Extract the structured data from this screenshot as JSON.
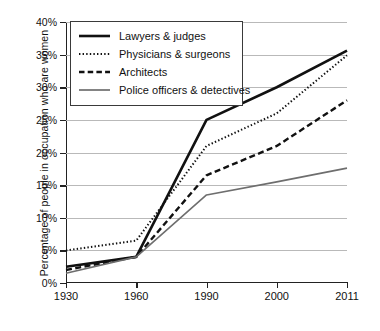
{
  "chart_data": {
    "type": "line",
    "title": "",
    "xlabel": "",
    "ylabel": "Percentage of people in occupation who are women",
    "x": [
      "1930",
      "1960",
      "1990",
      "2000",
      "2011"
    ],
    "categories": [
      "1930",
      "1960",
      "1990",
      "2000",
      "2011"
    ],
    "ylim": [
      0,
      40
    ],
    "yticks": [
      0,
      5,
      10,
      15,
      20,
      25,
      30,
      35,
      40
    ],
    "ytick_labels": [
      "0%",
      "5%",
      "10%",
      "15%",
      "20%",
      "25%",
      "30%",
      "35%",
      "40%"
    ],
    "grid": true,
    "legend_position": "top-left",
    "series": [
      {
        "name": "Lawyers & judges",
        "style": "solid",
        "color": "#111111",
        "width": 2.6,
        "values": [
          2.5,
          4.0,
          25.0,
          30.0,
          35.6
        ]
      },
      {
        "name": "Physicians & surgeons",
        "style": "dotted",
        "color": "#111111",
        "width": 2.0,
        "values": [
          5.0,
          6.5,
          21.0,
          26.0,
          34.9
        ]
      },
      {
        "name": "Architects",
        "style": "dashed",
        "color": "#111111",
        "width": 2.4,
        "values": [
          2.0,
          4.0,
          16.5,
          21.0,
          28.0
        ]
      },
      {
        "name": "Police officers & detectives",
        "style": "solid",
        "color": "#6e6e6e",
        "width": 1.6,
        "values": [
          1.5,
          4.0,
          13.5,
          15.5,
          17.6
        ]
      }
    ]
  },
  "legend": {
    "items": [
      {
        "label": "Lawyers & judges"
      },
      {
        "label": "Physicians & surgeons"
      },
      {
        "label": "Architects"
      },
      {
        "label": "Police officers & detectives"
      }
    ]
  }
}
